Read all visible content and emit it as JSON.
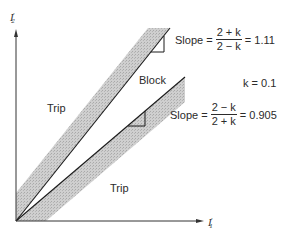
{
  "axes": {
    "y_label": "I",
    "y_label_prime": "′",
    "y_label_sub": "2",
    "x_label": "I",
    "x_label_prime": "′",
    "x_label_sub": "1"
  },
  "regions": {
    "trip_upper": "Trip",
    "block": "Block",
    "trip_lower": "Trip"
  },
  "formulas": {
    "upper": {
      "prefix": "Slope =",
      "numerator": "2 + k",
      "denominator": "2 − k",
      "result": "= 1.11"
    },
    "k_value": "k = 0.1",
    "lower": {
      "prefix": "Slope =",
      "numerator": "2 − k",
      "denominator": "2 + k",
      "result": "= 0.905"
    }
  },
  "colors": {
    "band_fill": "#c4c4c4",
    "line": "#1a1a1a",
    "axis": "#333333"
  }
}
